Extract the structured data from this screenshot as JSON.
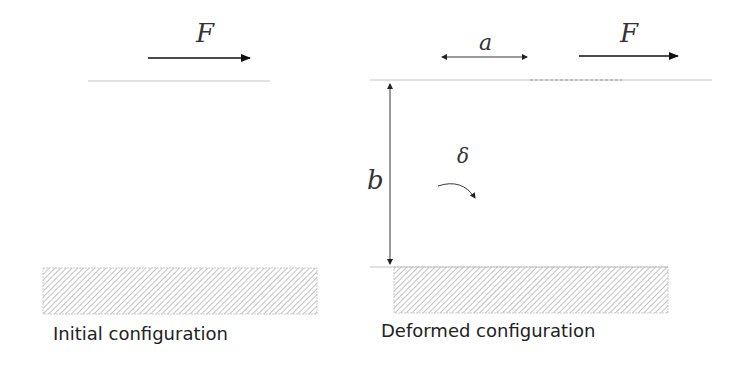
{
  "diagram": {
    "panels": [
      {
        "id": "initial",
        "caption": "Initial configuration",
        "force_label": "F"
      },
      {
        "id": "deformed",
        "caption": "Deformed configuration",
        "force_label": "F",
        "displacement_label": "a",
        "height_label": "b",
        "angle_label": "δ"
      }
    ],
    "colors": {
      "stroke": "#222222",
      "light_line": "#bbbbbb",
      "hatch": "#999999",
      "text": "#222222"
    }
  }
}
